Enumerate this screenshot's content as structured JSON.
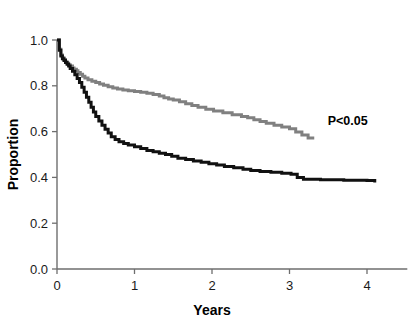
{
  "chart_data": {
    "type": "line",
    "subtype": "kaplan-meier-step",
    "title": "",
    "xlabel": "Years",
    "ylabel": "Proportion",
    "xlim": [
      0,
      4.5
    ],
    "ylim": [
      0,
      1.0
    ],
    "xticks": [
      0,
      1,
      2,
      3,
      4
    ],
    "xtick_labels": [
      "0",
      "1",
      "2",
      "3",
      "4"
    ],
    "yticks": [
      0.0,
      0.2,
      0.4,
      0.6,
      0.8,
      1.0
    ],
    "ytick_labels": [
      "0.0",
      "0.2",
      "0.4",
      "0.6",
      "0.8",
      "1.0"
    ],
    "grid": false,
    "legend": false,
    "legend_position": "none",
    "annotations": [
      {
        "text": "P<0.05",
        "x": 3.75,
        "y": 0.63
      }
    ],
    "series": [
      {
        "name": "upper-curve",
        "color": "#808080",
        "label": "",
        "step": "post",
        "x_end": 3.3,
        "y_end": 0.565,
        "x": [
          0.0,
          0.03,
          0.05,
          0.07,
          0.09,
          0.11,
          0.13,
          0.15,
          0.17,
          0.2,
          0.22,
          0.25,
          0.27,
          0.3,
          0.33,
          0.36,
          0.4,
          0.45,
          0.5,
          0.55,
          0.6,
          0.66,
          0.72,
          0.78,
          0.85,
          0.92,
          1.0,
          1.08,
          1.16,
          1.24,
          1.32,
          1.38,
          1.44,
          1.5,
          1.58,
          1.66,
          1.74,
          1.82,
          1.92,
          2.02,
          2.14,
          2.26,
          2.38,
          2.46,
          2.54,
          2.62,
          2.7,
          2.8,
          2.9,
          3.0,
          3.08,
          3.16,
          3.24,
          3.3
        ],
        "y": [
          1.0,
          0.96,
          0.935,
          0.922,
          0.915,
          0.905,
          0.898,
          0.892,
          0.886,
          0.878,
          0.872,
          0.866,
          0.858,
          0.85,
          0.842,
          0.834,
          0.826,
          0.82,
          0.814,
          0.808,
          0.802,
          0.796,
          0.79,
          0.786,
          0.782,
          0.778,
          0.775,
          0.772,
          0.768,
          0.762,
          0.755,
          0.748,
          0.742,
          0.738,
          0.73,
          0.722,
          0.714,
          0.706,
          0.698,
          0.69,
          0.682,
          0.674,
          0.666,
          0.66,
          0.652,
          0.644,
          0.636,
          0.628,
          0.62,
          0.612,
          0.598,
          0.585,
          0.572,
          0.565
        ]
      },
      {
        "name": "lower-curve",
        "color": "#111111",
        "label": "",
        "step": "post",
        "x_end": 4.1,
        "y_end": 0.378,
        "x": [
          0.0,
          0.03,
          0.05,
          0.07,
          0.09,
          0.11,
          0.13,
          0.15,
          0.17,
          0.2,
          0.23,
          0.26,
          0.29,
          0.32,
          0.35,
          0.38,
          0.41,
          0.44,
          0.47,
          0.5,
          0.54,
          0.58,
          0.62,
          0.66,
          0.7,
          0.75,
          0.8,
          0.86,
          0.92,
          1.0,
          1.08,
          1.16,
          1.24,
          1.32,
          1.4,
          1.48,
          1.56,
          1.66,
          1.76,
          1.86,
          1.96,
          2.06,
          2.16,
          2.28,
          2.4,
          2.5,
          2.62,
          2.76,
          2.9,
          3.02,
          3.1,
          3.18,
          3.4,
          3.7,
          4.0,
          4.1
        ],
        "y": [
          1.0,
          0.955,
          0.93,
          0.918,
          0.91,
          0.902,
          0.894,
          0.886,
          0.876,
          0.864,
          0.848,
          0.832,
          0.814,
          0.794,
          0.772,
          0.75,
          0.728,
          0.706,
          0.686,
          0.666,
          0.646,
          0.628,
          0.61,
          0.594,
          0.578,
          0.566,
          0.556,
          0.548,
          0.542,
          0.534,
          0.526,
          0.518,
          0.512,
          0.506,
          0.5,
          0.492,
          0.484,
          0.478,
          0.472,
          0.466,
          0.46,
          0.454,
          0.448,
          0.442,
          0.436,
          0.43,
          0.426,
          0.422,
          0.418,
          0.414,
          0.4,
          0.392,
          0.39,
          0.388,
          0.386,
          0.378
        ]
      }
    ]
  },
  "axes": {
    "x_title": "Years",
    "y_title": "Proportion"
  },
  "annotation": {
    "p_value": "P<0.05"
  },
  "colors": {
    "upper_curve": "#808080",
    "lower_curve": "#111111",
    "axis": "#6e6e6e",
    "text": "#1a1a1a",
    "background": "#ffffff"
  }
}
